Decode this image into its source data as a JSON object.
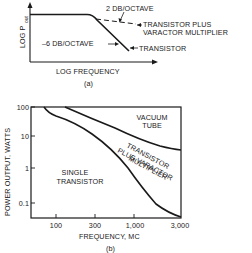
{
  "figure_a": {
    "caption": "(a)",
    "y_axis_label": "LOG P",
    "y_axis_subscript": "out",
    "x_axis_label": "LOG FREQUENCY",
    "annotations": {
      "slope_multiplier": "2 DB/OCTAVE",
      "slope_transistor": "–6 DB/OCTAVE",
      "curve_multiplier_line1": "TRANSISTOR PLUS",
      "curve_multiplier_line2": "VARACTOR MULTIPLIER",
      "curve_transistor": "TRANSISTOR"
    }
  },
  "figure_b": {
    "caption": "(b)",
    "y_axis_label": "POWER OUTPUT, WATTS",
    "x_axis_label": "FREQUENCY, MC",
    "y_ticks": [
      "100",
      "10",
      "1",
      "0.1"
    ],
    "x_ticks": [
      "100",
      "300",
      "1,000",
      "3,000"
    ],
    "regions": {
      "vacuum_tube_line1": "VACUUM",
      "vacuum_tube_line2": "TUBE",
      "multiplier_line1": "TRANSISTOR",
      "multiplier_line2": "PLUS VARACTOR",
      "multiplier_line3": "MULTIPLIER",
      "single_line1": "SINGLE",
      "single_line2": "TRANSISTOR"
    }
  }
}
